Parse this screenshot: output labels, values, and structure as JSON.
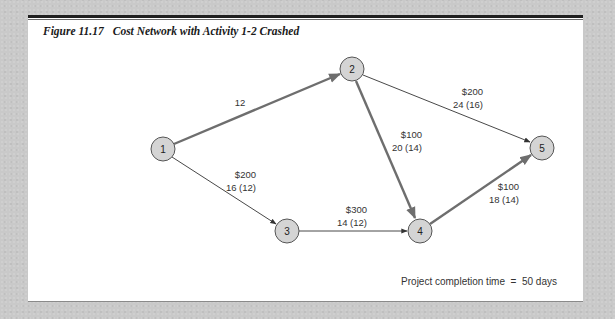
{
  "figure": {
    "number": "Figure 11.17",
    "title": "Cost Network with Activity 1-2 Crashed"
  },
  "nodes": [
    {
      "id": "1",
      "label": "1",
      "x": 163,
      "y": 149
    },
    {
      "id": "2",
      "label": "2",
      "x": 352,
      "y": 69
    },
    {
      "id": "3",
      "label": "3",
      "x": 287,
      "y": 231
    },
    {
      "id": "4",
      "label": "4",
      "x": 420,
      "y": 231
    },
    {
      "id": "5",
      "label": "5",
      "x": 542,
      "y": 148
    }
  ],
  "edges": [
    {
      "from": "1",
      "to": "2",
      "critical": true,
      "cost": "",
      "time": "12"
    },
    {
      "from": "1",
      "to": "3",
      "critical": false,
      "cost": "$200",
      "time": "16 (12)"
    },
    {
      "from": "2",
      "to": "5",
      "critical": false,
      "cost": "$200",
      "time": "24 (16)"
    },
    {
      "from": "2",
      "to": "4",
      "critical": true,
      "cost": "$100",
      "time": "20 (14)"
    },
    {
      "from": "3",
      "to": "4",
      "critical": false,
      "cost": "$300",
      "time": "14 (12)"
    },
    {
      "from": "4",
      "to": "5",
      "critical": true,
      "cost": "$100",
      "time": "18 (14)"
    }
  ],
  "labels": {
    "e12_time": "12",
    "e13_cost": "$200",
    "e13_time": "16 (12)",
    "e25_cost": "$200",
    "e25_time": "24 (16)",
    "e24_cost": "$100",
    "e24_time": "20 (14)",
    "e34_cost": "$300",
    "e34_time": "14 (12)",
    "e45_cost": "$100",
    "e45_time": "18 (14)"
  },
  "footnote": "Project completion time  =  50 days",
  "colors": {
    "critical_edge": "#6e6e6e",
    "normal_edge": "#333333",
    "node_fill": "#d4d4d4",
    "node_stroke": "#555555"
  }
}
